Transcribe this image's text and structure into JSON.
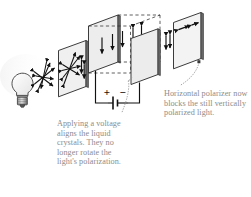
{
  "figure": {
    "background_color": "#ffffff",
    "caption_color": "#8c8c8c",
    "line_color": "#1a1a1a",
    "panel_fill": "#f2f2f2",
    "panel_edge": "#3c3c3c"
  },
  "captions": {
    "voltage": "Applying a voltage aligns the liquid crystals.  They no longer rotate the light's polarization.",
    "polarizer": "Horizontal polarizer now blocks the still vertically polarized light."
  },
  "battery": {
    "positive_label": "+",
    "negative_label": "−"
  },
  "components": [
    {
      "name": "light-bulb",
      "label": "Light source",
      "description": "Incandescent bulb emitting unpolarized light"
    },
    {
      "name": "unpolarized-beam",
      "label": "Unpolarized light",
      "description": "Starburst of double-headed arrows in all orientations"
    },
    {
      "name": "vertical-polarizer",
      "label": "Vertical polarizer",
      "description": "First polarizing filter; transmits vertically polarized light"
    },
    {
      "name": "liquid-crystal-cell",
      "label": "Liquid crystal cell",
      "description": "Cell between electrodes, crystals aligned by applied voltage"
    },
    {
      "name": "battery",
      "label": "Voltage source",
      "description": "Battery connected across the liquid crystal cell"
    },
    {
      "name": "horizontal-polarizer",
      "label": "Horizontal polarizer",
      "description": "Second polarizing filter rotated 90 degrees; blocks the light"
    }
  ]
}
